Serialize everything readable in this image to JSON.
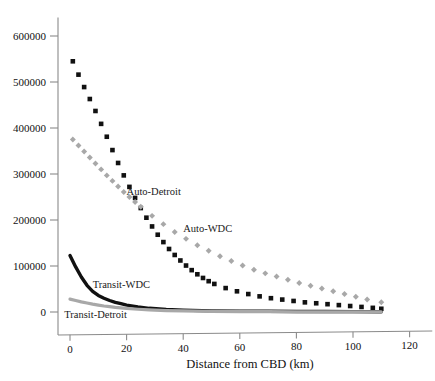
{
  "chart_data": {
    "type": "line",
    "title": "",
    "xlabel": "Distance from CBD (km)",
    "ylabel": "",
    "xlim": [
      -5,
      128
    ],
    "ylim": [
      -30000,
      640000
    ],
    "grid": false,
    "legend_position": "inline-annotations",
    "xticks": [
      0,
      20,
      40,
      60,
      80,
      100,
      120
    ],
    "xtick_labels": [
      "0",
      "20",
      "40",
      "60",
      "80",
      "100",
      "120"
    ],
    "yticks": [
      0,
      100000,
      200000,
      300000,
      400000,
      500000,
      600000
    ],
    "ytick_labels": [
      "0",
      "100000",
      "200000",
      "300000",
      "400000",
      "500000",
      "600000"
    ],
    "series": [
      {
        "name": "Auto-WDC",
        "style": "dashed",
        "marker": "square",
        "color": "#111111",
        "label_x": 40,
        "label_y": 175000,
        "x": [
          1,
          3,
          5,
          7,
          9,
          11,
          13,
          15,
          17,
          19,
          21,
          23,
          25,
          27,
          29,
          31,
          33,
          35,
          37,
          39,
          41,
          43,
          45,
          47,
          49,
          51,
          55,
          59,
          63,
          67,
          71,
          75,
          79,
          83,
          87,
          91,
          95,
          99,
          103,
          107,
          110
        ],
        "y": [
          545000,
          516000,
          489000,
          463000,
          437000,
          409000,
          381000,
          352000,
          324000,
          297000,
          272000,
          248000,
          226000,
          205000,
          186000,
          168000,
          152000,
          137000,
          124000,
          112000,
          101000,
          91000,
          82000,
          74000,
          67000,
          61000,
          52000,
          45000,
          39000,
          34000,
          30000,
          27000,
          24000,
          21000,
          19000,
          17000,
          15000,
          13000,
          11000,
          9000,
          7000
        ]
      },
      {
        "name": "Auto-Detroit",
        "style": "dashed",
        "marker": "diamond",
        "color": "#a8a8a8",
        "label_x": 20,
        "label_y": 255000,
        "x": [
          1,
          3,
          5,
          7,
          9,
          11,
          13,
          15,
          17,
          19,
          21,
          23,
          25,
          29,
          33,
          37,
          41,
          45,
          49,
          53,
          57,
          61,
          65,
          69,
          73,
          77,
          81,
          85,
          89,
          93,
          97,
          101,
          105,
          110
        ],
        "y": [
          375000,
          362000,
          349000,
          336000,
          323000,
          310000,
          297000,
          285000,
          273000,
          261000,
          250000,
          239000,
          229000,
          209000,
          191000,
          174000,
          159000,
          145000,
          133000,
          121000,
          111000,
          101000,
          92000,
          84000,
          77000,
          70000,
          63000,
          57000,
          51000,
          45000,
          39000,
          33000,
          27000,
          21000
        ]
      },
      {
        "name": "Transit-WDC",
        "style": "solid",
        "marker": "none",
        "color": "#111111",
        "label_x": 8,
        "label_y": 52000,
        "x": [
          0,
          2,
          4,
          6,
          8,
          10,
          12,
          14,
          16,
          18,
          20,
          24,
          28,
          34,
          40,
          50,
          60,
          70,
          80,
          90,
          100,
          110
        ],
        "y": [
          123000,
          98000,
          76000,
          58000,
          45000,
          36000,
          30000,
          25000,
          21000,
          18000,
          15000,
          11000,
          8000,
          5500,
          4000,
          2500,
          2000,
          1500,
          1200,
          1000,
          800,
          600
        ]
      },
      {
        "name": "Transit-Detroit",
        "style": "solid",
        "marker": "none",
        "color": "#a8a8a8",
        "label_x": -2,
        "label_y": -12000,
        "x": [
          0,
          2,
          4,
          6,
          8,
          10,
          12,
          14,
          16,
          18,
          20,
          24,
          28,
          34,
          40,
          50,
          60,
          70,
          80,
          90,
          100,
          110
        ],
        "y": [
          28000,
          25000,
          22000,
          19500,
          17000,
          15000,
          13000,
          11500,
          10000,
          8800,
          7800,
          6000,
          4600,
          3200,
          2300,
          1400,
          900,
          700,
          500,
          400,
          300,
          250
        ]
      }
    ]
  }
}
